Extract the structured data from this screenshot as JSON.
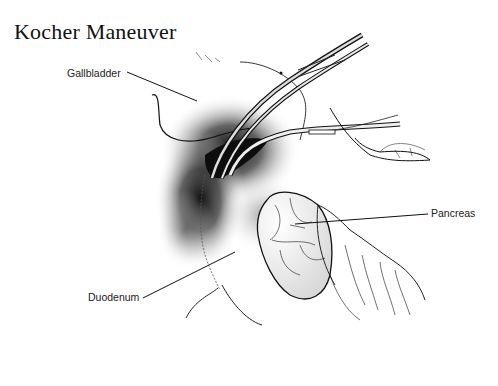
{
  "figure": {
    "title": "Kocher Maneuver",
    "labels": {
      "gallbladder": "Gallbladder",
      "pancreas": "Pancreas",
      "duodenum": "Duodenum"
    },
    "colors": {
      "background": "#ffffff",
      "ink": "#111111",
      "shadow": "#1a1a1a"
    }
  }
}
